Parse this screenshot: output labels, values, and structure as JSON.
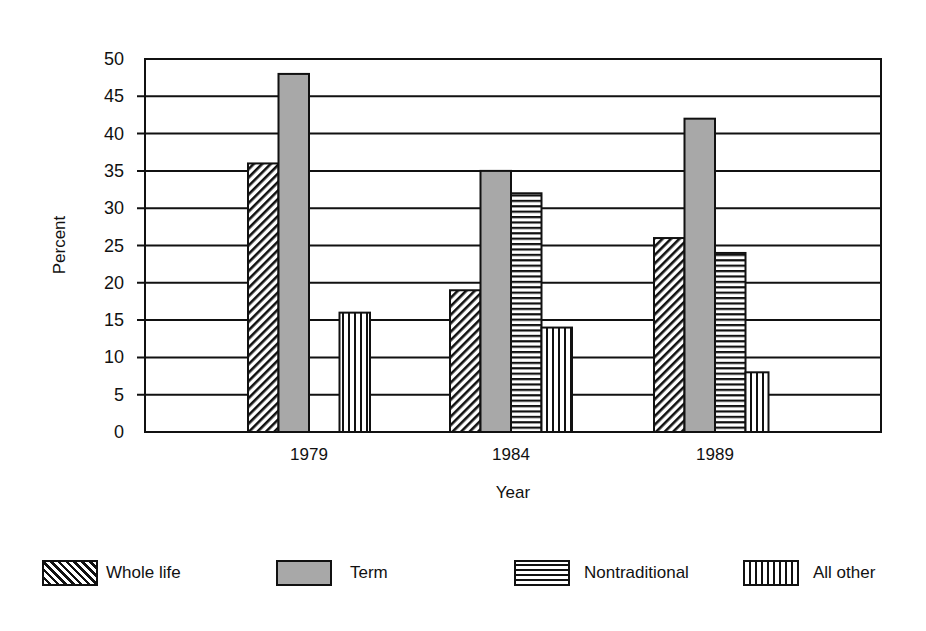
{
  "chart_data": {
    "type": "bar",
    "title": "",
    "xlabel": "Year",
    "ylabel": "Percent",
    "categories": [
      "1979",
      "1984",
      "1989"
    ],
    "series": [
      {
        "name": "Whole life",
        "pattern": "diagonal-hatch",
        "values": [
          36,
          19,
          26
        ]
      },
      {
        "name": "Term",
        "pattern": "solid-gray",
        "color": "#a8a8a8",
        "values": [
          48,
          35,
          42
        ]
      },
      {
        "name": "Nontraditional",
        "pattern": "horizontal-lines",
        "values": [
          0,
          32,
          24
        ]
      },
      {
        "name": "All other",
        "pattern": "vertical-lines",
        "values": [
          16,
          14,
          8
        ]
      }
    ],
    "ylim": [
      0,
      50
    ],
    "yticks": [
      0,
      5,
      10,
      15,
      20,
      25,
      30,
      35,
      40,
      45,
      50
    ],
    "grid": true,
    "legend_position": "bottom"
  },
  "legend": {
    "items": [
      {
        "label": "Whole life"
      },
      {
        "label": "Term"
      },
      {
        "label": "Nontraditional"
      },
      {
        "label": "All other"
      }
    ]
  }
}
